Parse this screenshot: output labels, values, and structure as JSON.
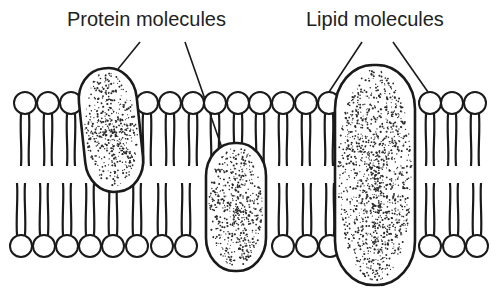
{
  "labels": {
    "protein": "Protein molecules",
    "lipid": "Lipid molecules"
  },
  "colors": {
    "stroke": "#1a1a1a",
    "background": "#ffffff",
    "stipple": "#2a2a2a"
  },
  "bilayer": {
    "head_radius": 11,
    "top_row_y": 103,
    "bottom_row_y": 246,
    "top_heads_x": [
      25,
      48,
      71,
      147,
      170,
      193,
      215,
      238,
      260,
      283,
      306,
      329,
      430,
      452,
      475
    ],
    "bottom_heads_x": [
      21,
      44,
      67,
      90,
      113,
      137,
      162,
      186,
      283,
      307,
      330,
      430,
      454,
      477
    ]
  },
  "proteins": [
    {
      "name": "protein-1",
      "cx": 111,
      "cy": 130,
      "rx": 29,
      "ry": 62,
      "rot": -6
    },
    {
      "name": "protein-2",
      "cx": 236,
      "cy": 207,
      "rx": 30,
      "ry": 64,
      "rot": 0
    },
    {
      "name": "protein-3",
      "cx": 375,
      "cy": 175,
      "rx": 40,
      "ry": 110,
      "rot": 0
    }
  ],
  "leaders": [
    {
      "from": [
        140,
        42
      ],
      "to": [
        118,
        69
      ]
    },
    {
      "from": [
        185,
        42
      ],
      "to": [
        222,
        148
      ]
    },
    {
      "from": [
        362,
        42
      ],
      "to": [
        329,
        92
      ]
    },
    {
      "from": [
        393,
        42
      ],
      "to": [
        428,
        92
      ]
    }
  ]
}
